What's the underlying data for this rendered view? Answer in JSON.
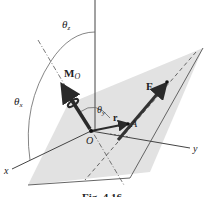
{
  "figure": {
    "caption": "Fig. 4.16",
    "colors": {
      "plane": "#e2e2e2",
      "axis": "#444444",
      "vector": "#2a2a2a",
      "background": "#ffffff"
    },
    "labels": {
      "theta_z": "θ",
      "theta_z_sub": "z",
      "theta_x": "θ",
      "theta_x_sub": "x",
      "theta_y": "θ",
      "theta_y_sub": "y",
      "moment": "M",
      "moment_sub": "O",
      "force": "F",
      "position": "r",
      "point_a": "A",
      "origin": "O",
      "x_axis": "x",
      "y_axis": "y"
    }
  }
}
